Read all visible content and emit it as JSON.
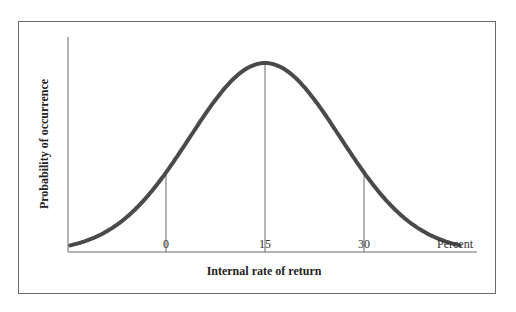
{
  "chart_data": {
    "type": "line",
    "title": "",
    "xlabel": "Internal rate of return",
    "ylabel": "Probability of occurrence",
    "x_unit_label": "Percent",
    "x_ticks": [
      0,
      15,
      30
    ],
    "x_tick_labels": [
      "0",
      "15",
      "30"
    ],
    "distribution": "normal",
    "mean": 15,
    "std_dev_approx": 11.4,
    "reference_lines_at": [
      0,
      15,
      30
    ],
    "y_ticks": [],
    "grid": false,
    "legend": null,
    "series": [
      {
        "name": "Probability distribution of IRR",
        "x": [
          -14,
          -10,
          -5,
          0,
          5,
          10,
          15,
          20,
          25,
          30,
          35,
          40,
          44
        ],
        "y": [
          0.04,
          0.11,
          0.24,
          0.42,
          0.68,
          0.91,
          1.0,
          0.91,
          0.68,
          0.42,
          0.24,
          0.11,
          0.04
        ],
        "color": "#4a4a4a"
      }
    ]
  },
  "colors": {
    "curve": "#4a4a4a",
    "axis": "#6a6a6a",
    "frame": "#6a6a6a"
  }
}
